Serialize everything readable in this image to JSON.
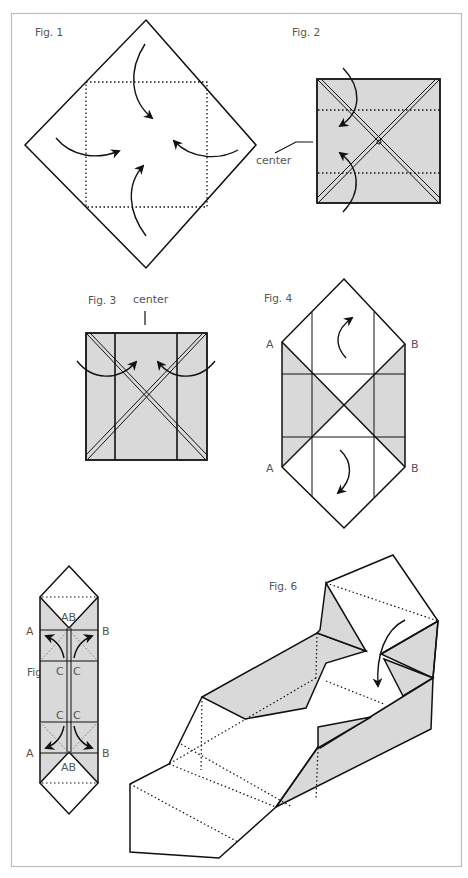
{
  "colors": {
    "shade": "#d9d9d9",
    "line": "#111111",
    "label": "#555555",
    "frame": "#bfbfbf"
  },
  "figures": [
    {
      "id": "fig1",
      "label": "Fig. 1"
    },
    {
      "id": "fig2",
      "label": "Fig. 2",
      "callout": "center"
    },
    {
      "id": "fig3",
      "label": "Fig. 3",
      "callout": "center"
    },
    {
      "id": "fig4",
      "label": "Fig. 4",
      "points": [
        "A",
        "B",
        "A",
        "B"
      ]
    },
    {
      "id": "fig5",
      "label": "Fig. 5",
      "points": [
        "A",
        "B",
        "A",
        "B",
        "AB",
        "AB",
        "C",
        "C",
        "C",
        "C"
      ]
    },
    {
      "id": "fig6",
      "label": "Fig. 6"
    }
  ]
}
